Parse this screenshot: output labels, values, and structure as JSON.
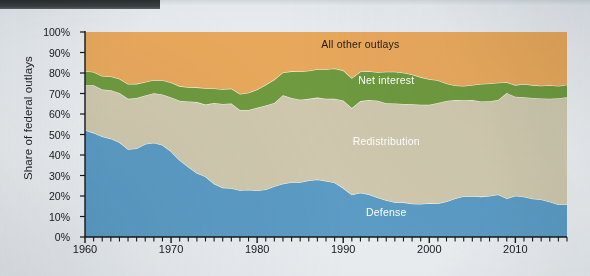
{
  "figure": {
    "background_color": "#e9edf0",
    "plot": {
      "left": 85,
      "top": 32,
      "right": 567,
      "bottom": 237
    }
  },
  "chart_data": {
    "type": "area",
    "stacked": true,
    "normalized_percent": true,
    "title": "",
    "xlabel": "",
    "ylabel": "Share of federal outlays",
    "xlim": [
      1960,
      2016
    ],
    "ylim": [
      0,
      100
    ],
    "grid": false,
    "legend_position": "inline-labels",
    "y_ticks": [
      "0%",
      "10%",
      "20%",
      "30%",
      "40%",
      "50%",
      "60%",
      "70%",
      "80%",
      "90%",
      "100%"
    ],
    "y_tick_values": [
      0,
      10,
      20,
      30,
      40,
      50,
      60,
      70,
      80,
      90,
      100
    ],
    "x_ticks": [
      "1960",
      "1970",
      "1980",
      "1990",
      "2000",
      "2010"
    ],
    "x_tick_values": [
      1960,
      1970,
      1980,
      1990,
      2000,
      2010
    ],
    "x_minor_tick_interval": 1,
    "x": [
      1960,
      1961,
      1962,
      1963,
      1964,
      1965,
      1966,
      1967,
      1968,
      1969,
      1970,
      1971,
      1972,
      1973,
      1974,
      1975,
      1976,
      1977,
      1978,
      1979,
      1980,
      1981,
      1982,
      1983,
      1984,
      1985,
      1986,
      1987,
      1988,
      1989,
      1990,
      1991,
      1992,
      1993,
      1994,
      1995,
      1996,
      1997,
      1998,
      1999,
      2000,
      2001,
      2002,
      2003,
      2004,
      2005,
      2006,
      2007,
      2008,
      2009,
      2010,
      2011,
      2012,
      2013,
      2014,
      2015,
      2016
    ],
    "series": [
      {
        "name": "Defense",
        "color": "#5b9bc4",
        "label_color": "#ffffff",
        "values": [
          52.2,
          50.8,
          49.0,
          48.0,
          46.2,
          42.8,
          43.2,
          45.4,
          46.0,
          44.9,
          41.8,
          37.5,
          34.3,
          31.2,
          29.5,
          26.0,
          24.1,
          23.8,
          22.8,
          23.1,
          22.7,
          23.2,
          24.8,
          26.0,
          26.7,
          26.7,
          27.6,
          28.1,
          27.3,
          26.6,
          23.9,
          20.6,
          21.6,
          20.7,
          19.3,
          17.9,
          17.0,
          16.9,
          16.2,
          16.1,
          16.5,
          16.4,
          17.3,
          18.8,
          19.9,
          20.0,
          19.7,
          20.0,
          20.7,
          18.8,
          20.1,
          19.6,
          18.7,
          18.3,
          17.2,
          15.9,
          15.9
        ],
        "endpoints": {
          "1960": 52.2,
          "1965": 42.8,
          "1968": 46.0,
          "1978": 22.8,
          "1987": 28.1,
          "2000": 16.5,
          "2010": 20.1,
          "2016": 15.9
        }
      },
      {
        "name": "Redistribution",
        "color": "#cfc8ae",
        "label_color": "#ffffff",
        "values": [
          21.8,
          23.2,
          23.0,
          23.6,
          24.0,
          24.6,
          24.6,
          23.6,
          24.1,
          24.6,
          26.2,
          29.0,
          31.8,
          34.6,
          35.1,
          39.4,
          40.8,
          41.3,
          39.2,
          38.9,
          40.4,
          41.0,
          40.6,
          43.2,
          41.1,
          40.3,
          39.8,
          39.9,
          40.2,
          40.8,
          42.7,
          42.3,
          44.7,
          46.1,
          47.2,
          47.4,
          48.1,
          48.0,
          48.5,
          48.4,
          48.0,
          49.0,
          49.1,
          48.0,
          46.8,
          46.8,
          46.4,
          46.2,
          46.1,
          51.4,
          48.3,
          48.6,
          49.1,
          49.3,
          50.3,
          51.8,
          52.3
        ],
        "cumulative_top_endpoints": {
          "1960": 74.0,
          "1970": 68.0,
          "1980": 63.1,
          "1990": 66.6,
          "2000": 64.5,
          "2010": 68.4,
          "2016": 68.2
        }
      },
      {
        "name": "Net interest",
        "color": "#6f9a3f",
        "label_color": "#ffffff",
        "values": [
          7.0,
          6.5,
          6.5,
          6.7,
          7.0,
          7.2,
          6.9,
          6.6,
          6.5,
          7.0,
          7.4,
          7.1,
          7.0,
          7.2,
          8.0,
          7.1,
          7.2,
          7.3,
          7.8,
          8.4,
          8.9,
          10.1,
          11.4,
          11.1,
          13.0,
          13.7,
          13.7,
          13.8,
          14.3,
          14.8,
          14.7,
          14.7,
          14.4,
          14.1,
          13.9,
          15.3,
          15.5,
          15.2,
          14.6,
          13.5,
          12.5,
          11.1,
          8.5,
          7.1,
          7.0,
          7.4,
          8.5,
          8.7,
          8.5,
          5.3,
          5.7,
          6.4,
          6.3,
          6.2,
          6.5,
          6.0,
          6.1
        ],
        "cumulative_top_endpoints": {
          "1960": 81.0,
          "1970": 75.4,
          "1980": 72.0,
          "1990": 81.3,
          "1997": 81.5,
          "2009": 75.5,
          "2010": 74.1,
          "2016": 74.3
        }
      },
      {
        "name": "All other outlays",
        "color": "#e8a85c",
        "label_color": "#201a10",
        "values": [
          19.0,
          19.5,
          21.5,
          21.7,
          22.8,
          25.4,
          25.3,
          24.4,
          23.4,
          23.5,
          24.6,
          26.4,
          26.9,
          27.0,
          27.4,
          27.5,
          27.9,
          27.6,
          30.2,
          29.6,
          28.0,
          25.7,
          23.2,
          19.7,
          19.2,
          19.3,
          18.9,
          18.2,
          18.2,
          17.8,
          18.7,
          22.4,
          19.3,
          19.1,
          19.6,
          19.4,
          19.4,
          19.9,
          20.7,
          22.0,
          23.0,
          23.5,
          25.1,
          26.1,
          26.3,
          25.8,
          25.4,
          25.1,
          24.7,
          24.5,
          25.9,
          25.4,
          25.9,
          26.2,
          26.0,
          26.3,
          25.7
        ],
        "cumulative_top": 100
      }
    ],
    "annotations": [
      {
        "text": "All other outlays",
        "x": 1992,
        "y": 94,
        "color": "#201a10"
      },
      {
        "text": "Net interest",
        "x": 1995,
        "y": 76.5,
        "color": "#ffffff"
      },
      {
        "text": "Redistribution",
        "x": 1995,
        "y": 47,
        "color": "#ffffff"
      },
      {
        "text": "Defense",
        "x": 1995,
        "y": 12,
        "color": "#ffffff"
      }
    ]
  }
}
